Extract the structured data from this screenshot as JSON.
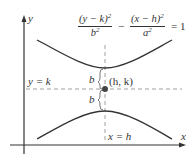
{
  "diagram": {
    "type": "hyperbola-vertical",
    "equation": {
      "term1_numerator": "(y − k)",
      "term1_denominator": "b",
      "minus": "−",
      "term2_numerator": "(x − h)",
      "term2_denominator": "a",
      "exponent": "2",
      "equals": "= 1"
    },
    "axes": {
      "x_label": "x",
      "y_label": "y"
    },
    "lines": {
      "horizontal_label": "y = k",
      "vertical_label": "x = h"
    },
    "center_label": "(h, k)",
    "distance_labels": [
      "b",
      "b"
    ],
    "colors": {
      "ink": "#333333",
      "dashed": "#888888",
      "background": "#ffffff"
    }
  }
}
